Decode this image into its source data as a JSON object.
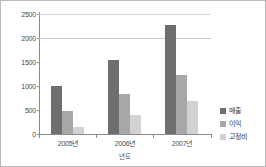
{
  "chart_data": {
    "type": "bar",
    "title": "",
    "xlabel": "년도",
    "ylabel": "",
    "ylim": [
      0,
      2500
    ],
    "yticks": [
      0,
      500,
      1000,
      1500,
      2000,
      2500
    ],
    "ytick_labels": [
      "0",
      "500",
      "1000",
      "1500",
      "2000",
      "2500"
    ],
    "categories": [
      "2005년",
      "2006년",
      "2007년"
    ],
    "series": [
      {
        "name": "매출",
        "color": "#6e6e6e",
        "values": [
          1000,
          1550,
          2270
        ]
      },
      {
        "name": "이익",
        "color": "#a8a8a8",
        "values": [
          480,
          830,
          1230
        ]
      },
      {
        "name": "고정비",
        "color": "#d2d2d2",
        "values": [
          140,
          400,
          680
        ]
      }
    ],
    "legend_position": "right",
    "grid": true,
    "gridlines": [
      2000,
      2500
    ],
    "border": true
  },
  "legend": {
    "items": [
      {
        "label": "매출"
      },
      {
        "label": "이익"
      },
      {
        "label": "고정비"
      }
    ]
  }
}
